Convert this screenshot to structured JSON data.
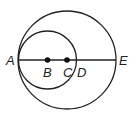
{
  "diagram": {
    "type": "geometry",
    "colors": {
      "stroke": "#222222",
      "background": "#ffffff"
    },
    "large_circle": {
      "center_point": "C",
      "cx": 67,
      "cy": 60,
      "r": 49
    },
    "small_circle": {
      "center_point": "B",
      "cx": 47.5,
      "cy": 60,
      "r": 29
    },
    "segment": {
      "from": "A",
      "to": "E"
    },
    "points": [
      {
        "label": "A",
        "x": 18,
        "y": 60,
        "dot": false
      },
      {
        "label": "B",
        "x": 47.5,
        "y": 60,
        "dot": true
      },
      {
        "label": "C",
        "x": 67,
        "y": 60,
        "dot": true
      },
      {
        "label": "D",
        "x": 76.5,
        "y": 60,
        "dot": false
      },
      {
        "label": "E",
        "x": 116,
        "y": 60,
        "dot": false
      }
    ],
    "labels": {
      "A": "A",
      "B": "B",
      "C": "C",
      "D": "D",
      "E": "E"
    }
  }
}
